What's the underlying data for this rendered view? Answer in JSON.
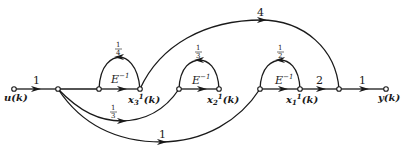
{
  "diagram": {
    "type": "signal-flow-graph",
    "colors": {
      "ink": "#1a1a1a",
      "background": "#ffffff"
    },
    "nodes": {
      "input": {
        "label": "u(k)",
        "x": 14,
        "y": 89
      },
      "n1": {
        "x": 58,
        "y": 89
      },
      "x3_in": {
        "x": 99,
        "y": 89
      },
      "x3": {
        "label_base": "x",
        "label_sub": "3",
        "label_sup": "1",
        "label_arg": "(k)",
        "x": 140,
        "y": 89
      },
      "x2_in": {
        "x": 179,
        "y": 89
      },
      "x2": {
        "label_base": "x",
        "label_sub": "2",
        "label_sup": "1",
        "label_arg": "(k)",
        "x": 219,
        "y": 89
      },
      "x1_in": {
        "x": 260,
        "y": 89
      },
      "x1": {
        "label_base": "x",
        "label_sub": "1",
        "label_sup": "1",
        "label_arg": "(k)",
        "x": 300,
        "y": 89
      },
      "n2": {
        "x": 339,
        "y": 89
      },
      "output": {
        "label": "y(k)",
        "x": 386,
        "y": 89
      }
    },
    "edges": [
      {
        "id": "u-to-n1",
        "gain": "1"
      },
      {
        "id": "x3-delay",
        "gain": "E",
        "gain_sup": "−1"
      },
      {
        "id": "x3-loop",
        "gain_num": "1",
        "gain_den": "4"
      },
      {
        "id": "x2-delay",
        "gain": "E",
        "gain_sup": "−1"
      },
      {
        "id": "x2-loop",
        "gain_num": "1",
        "gain_den": "3"
      },
      {
        "id": "x1-delay",
        "gain": "E",
        "gain_sup": "−1"
      },
      {
        "id": "x1-loop",
        "gain_num": "1",
        "gain_den": "2"
      },
      {
        "id": "n1-to-x2in",
        "gain_num": "1",
        "gain_den": "3"
      },
      {
        "id": "n1-to-x1in",
        "gain": "1"
      },
      {
        "id": "x3-to-n2",
        "gain": "4"
      },
      {
        "id": "x1-to-n2",
        "gain": "2"
      },
      {
        "id": "n2-to-y",
        "gain": "1"
      }
    ],
    "labels": {
      "u": "u(k)",
      "y": "y(k)",
      "g_u": "1",
      "g_4": "4",
      "g_2": "2",
      "g_out": "1",
      "g_low": "1",
      "E": "E",
      "E_sup": "−1",
      "x3_num": "1",
      "x3_den": "4",
      "x2_num": "1",
      "x2_den": "3",
      "x1_num": "1",
      "x1_den": "2",
      "ff_num": "1",
      "ff_den": "3",
      "x": "x",
      "sub3": "3",
      "sub2": "2",
      "sub1": "1",
      "sup1": "1",
      "arg": "(k)"
    }
  }
}
